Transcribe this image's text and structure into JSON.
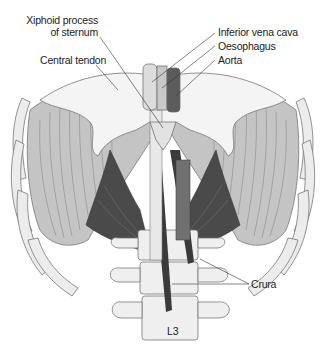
{
  "figure": {
    "colors": {
      "background": "#ffffff",
      "tendon": "#f2f2f2",
      "bone": "#ececec",
      "muscle_light": "#bdbdbd",
      "muscle_dark": "#4a4a4a",
      "outline": "#666666",
      "leader_line": "#333333",
      "label_text": "#222222"
    }
  },
  "labels": {
    "xiphoid_line1": "Xiphoid process",
    "xiphoid_line2": "of sternum",
    "central_tendon": "Central tendon",
    "inferior_vena_cava": "Inferior vena cava",
    "oesophagus": "Oesophagus",
    "aorta": "Aorta",
    "crura": "Crura",
    "vertebra": "L3"
  }
}
